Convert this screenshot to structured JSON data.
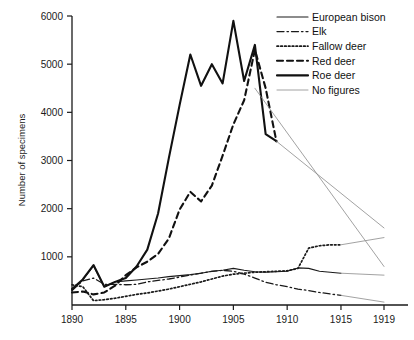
{
  "chart_data": {
    "type": "line",
    "title": "",
    "xlabel": "",
    "ylabel": "Number of specimens",
    "xlim": [
      1890,
      1919
    ],
    "ylim": [
      0,
      6000
    ],
    "grid": false,
    "legend_position": "top-right",
    "xticks": [
      "1890",
      "1895",
      "1900",
      "1905",
      "1910",
      "1915",
      "1919"
    ],
    "xtick_values": [
      1890,
      1895,
      1900,
      1905,
      1910,
      1915,
      1919
    ],
    "yticks": [
      "1000",
      "2000",
      "3000",
      "4000",
      "5000",
      "6000"
    ],
    "ytick_values": [
      1000,
      2000,
      3000,
      4000,
      5000,
      6000
    ],
    "series": [
      {
        "name": "European bison",
        "style": "solid-thin",
        "color": "#1a1a1a",
        "x": [
          1890,
          1891,
          1892,
          1893,
          1894,
          1895,
          1896,
          1897,
          1898,
          1899,
          1900,
          1901,
          1902,
          1903,
          1904,
          1905,
          1906,
          1907,
          1908,
          1909,
          1910,
          1911,
          1912,
          1913,
          1914,
          1915
        ],
        "values": [
          300,
          520,
          810,
          380,
          480,
          500,
          520,
          540,
          560,
          590,
          610,
          630,
          660,
          700,
          720,
          760,
          720,
          690,
          680,
          690,
          700,
          770,
          760,
          700,
          680,
          660
        ]
      },
      {
        "name": "Elk",
        "style": "dash-dot",
        "color": "#1a1a1a",
        "x": [
          1890,
          1891,
          1892,
          1893,
          1894,
          1895,
          1896,
          1897,
          1898,
          1899,
          1900,
          1901,
          1902,
          1903,
          1904,
          1905,
          1906,
          1907,
          1908,
          1909,
          1910,
          1911,
          1912,
          1913,
          1914,
          1915
        ],
        "values": [
          300,
          500,
          560,
          430,
          430,
          420,
          430,
          480,
          510,
          540,
          580,
          620,
          660,
          700,
          720,
          700,
          640,
          560,
          470,
          420,
          380,
          330,
          300,
          260,
          230,
          200
        ]
      },
      {
        "name": "Fallow deer",
        "style": "dotted",
        "color": "#1a1a1a",
        "x": [
          1890,
          1891,
          1892,
          1893,
          1894,
          1895,
          1896,
          1897,
          1898,
          1899,
          1900,
          1901,
          1902,
          1903,
          1904,
          1905,
          1906,
          1907,
          1908,
          1909,
          1910,
          1911,
          1912,
          1913,
          1914,
          1915
        ],
        "values": [
          420,
          380,
          90,
          110,
          140,
          180,
          220,
          250,
          290,
          330,
          380,
          430,
          480,
          540,
          600,
          640,
          660,
          680,
          690,
          700,
          710,
          760,
          1180,
          1230,
          1250,
          1250
        ]
      },
      {
        "name": "Red deer",
        "style": "dashed",
        "color": "#111111",
        "x": [
          1890,
          1891,
          1892,
          1893,
          1894,
          1895,
          1896,
          1897,
          1898,
          1899,
          1900,
          1901,
          1902,
          1903,
          1904,
          1905,
          1906,
          1907,
          1908,
          1909
        ],
        "values": [
          260,
          280,
          220,
          260,
          400,
          620,
          780,
          900,
          1060,
          1380,
          1980,
          2350,
          2150,
          2480,
          3100,
          3750,
          4250,
          5300,
          4500,
          3400
        ]
      },
      {
        "name": "Roe deer",
        "style": "solid-thick",
        "color": "#111111",
        "x": [
          1890,
          1891,
          1892,
          1893,
          1894,
          1895,
          1896,
          1897,
          1898,
          1899,
          1900,
          1901,
          1902,
          1903,
          1904,
          1905,
          1906,
          1907,
          1908,
          1909
        ],
        "values": [
          330,
          530,
          830,
          380,
          480,
          560,
          800,
          1150,
          1900,
          3050,
          4150,
          5200,
          4550,
          5000,
          4600,
          5900,
          4650,
          5400,
          3550,
          3400
        ]
      },
      {
        "name": "No figures",
        "style": "solid-hairline",
        "color": "#8a8a8a",
        "segments": [
          {
            "x": [
              1909,
              1919
            ],
            "values": [
              3400,
              1600
            ]
          },
          {
            "x": [
              1907,
              1919
            ],
            "values": [
              4500,
              800
            ]
          },
          {
            "x": [
              1915,
              1919
            ],
            "values": [
              1250,
              1400
            ]
          },
          {
            "x": [
              1915,
              1919
            ],
            "values": [
              660,
              620
            ]
          },
          {
            "x": [
              1915,
              1919
            ],
            "values": [
              200,
              60
            ]
          }
        ]
      }
    ],
    "legend": [
      {
        "label": "European bison",
        "style": "solid-thin"
      },
      {
        "label": "Elk",
        "style": "dash-dot"
      },
      {
        "label": "Fallow deer",
        "style": "dotted"
      },
      {
        "label": "Red deer",
        "style": "dashed"
      },
      {
        "label": "Roe deer",
        "style": "solid-thick"
      },
      {
        "label": "No figures",
        "style": "solid-hairline"
      }
    ]
  }
}
